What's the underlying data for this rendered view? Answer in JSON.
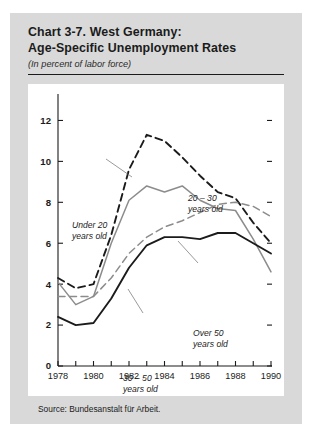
{
  "figure": {
    "title_line1": "Chart 3-7.  West Germany:",
    "title_line2": "Age-Specific Unemployment Rates",
    "subtitle": "(In percent of labor force)",
    "source": "Source:  Bundesanstalt für Arbeit."
  },
  "annotations": {
    "under20_l1": "Under 20",
    "under20_l2": "years old",
    "age2030_l1": "20 – 30",
    "age2030_l2": "years old",
    "age3050_l1": "30 – 50",
    "age3050_l2": "years old",
    "over50_l1": "Over 50",
    "over50_l2": "years old"
  },
  "colors": {
    "panel": "#d9d9d9",
    "plot_background": "#ffffff",
    "ink": "#1b1b1b",
    "gray_series": "#8c8c8c",
    "axis": "#1b1b1b"
  },
  "chart_data": {
    "type": "line",
    "title": "Chart 3-7.  West Germany: Age-Specific Unemployment Rates",
    "subtitle": "(In percent of labor force)",
    "xlabel": "",
    "ylabel": "In percent of labor force",
    "xlim": [
      1978,
      1990
    ],
    "ylim": [
      0,
      13
    ],
    "yticks": [
      0,
      2,
      4,
      6,
      8,
      10,
      12
    ],
    "ytick_labels": [
      "0",
      "2",
      "4",
      "6",
      "8",
      "10",
      "12"
    ],
    "xticks": [
      1978,
      1979,
      1980,
      1981,
      1982,
      1983,
      1984,
      1985,
      1986,
      1987,
      1988,
      1989,
      1990
    ],
    "xtick_labels": [
      "1978",
      "",
      "1980",
      "",
      "1982",
      "",
      "1984",
      "",
      "1986",
      "",
      "1988",
      "",
      "1990"
    ],
    "x": [
      1978,
      1979,
      1980,
      1981,
      1982,
      1983,
      1984,
      1985,
      1986,
      1987,
      1988,
      1989,
      1990
    ],
    "grid": false,
    "legend": "annotations-inline",
    "series": [
      {
        "name": "Under 20 years old",
        "style": "solid",
        "color": "#8c8c8c",
        "values": [
          4.1,
          3.0,
          3.4,
          6.0,
          8.1,
          8.8,
          8.5,
          8.8,
          8.1,
          7.7,
          7.6,
          6.2,
          4.6
        ]
      },
      {
        "name": "20 – 30 years old",
        "style": "dashed",
        "color": "#1b1b1b",
        "values": [
          4.3,
          3.8,
          4.0,
          6.4,
          9.6,
          11.3,
          11.0,
          10.2,
          9.3,
          8.5,
          8.2,
          7.0,
          6.0
        ]
      },
      {
        "name": "30 – 50 years old",
        "style": "dashed",
        "color": "#8c8c8c",
        "values": [
          3.4,
          3.4,
          3.4,
          4.3,
          5.5,
          6.3,
          6.8,
          7.1,
          7.5,
          7.9,
          8.0,
          7.8,
          7.3
        ]
      },
      {
        "name": "Over 50 years old",
        "style": "solid",
        "color": "#1b1b1b",
        "values": [
          2.4,
          2.0,
          2.1,
          3.3,
          4.8,
          5.9,
          6.3,
          6.3,
          6.2,
          6.5,
          6.5,
          6.0,
          5.5
        ]
      }
    ]
  }
}
